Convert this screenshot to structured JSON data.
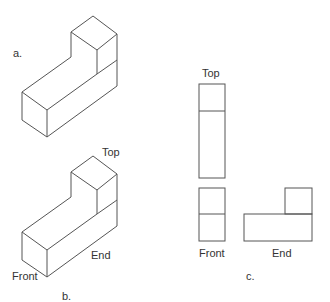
{
  "figure_a": {
    "label": "a."
  },
  "figure_b": {
    "label": "b.",
    "view_labels": {
      "top": "Top",
      "front": "Front",
      "end": "End"
    }
  },
  "figure_c": {
    "label": "c.",
    "view_labels": {
      "top": "Top",
      "front": "Front",
      "end": "End"
    }
  },
  "colors": {
    "line": "#555555",
    "text": "#333333",
    "background": "#ffffff"
  }
}
